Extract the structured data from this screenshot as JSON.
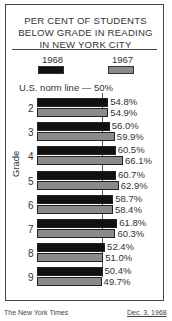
{
  "chart_data": {
    "type": "bar",
    "orientation": "horizontal",
    "title": "PER CENT OF STUDENTS BELOW GRADE IN READING IN NEW YORK CITY",
    "title_lines": [
      "PER CENT OF STUDENTS",
      "BELOW GRADE IN READING",
      "IN NEW YORK CITY"
    ],
    "xlabel": "",
    "ylabel": "Grade",
    "categories": [
      "2",
      "3",
      "4",
      "5",
      "6",
      "7",
      "8",
      "9"
    ],
    "series": [
      {
        "name": "1968",
        "color": "#111111",
        "values": [
          54.8,
          56.0,
          60.5,
          60.7,
          58.7,
          61.8,
          52.4,
          50.4
        ],
        "labels": [
          "54.8%",
          "56.0%",
          "60.5%",
          "60.7%",
          "58.7%",
          "61.8%",
          "52.4%",
          "50.4%"
        ]
      },
      {
        "name": "1967",
        "color": "#8a8a8a",
        "values": [
          54.9,
          59.9,
          66.1,
          62.9,
          58.4,
          60.3,
          51.0,
          49.7
        ],
        "labels": [
          "54.9%",
          "59.9%",
          "66.1%",
          "62.9%",
          "58.4%",
          "60.3%",
          "51.0%",
          "49.7%"
        ]
      }
    ],
    "reference_line": {
      "label": "U.S. norm line — 50%",
      "value": 50
    },
    "legend_position": "top",
    "grid": false
  },
  "legend": {
    "items": [
      {
        "label": "1968",
        "color": "#111111"
      },
      {
        "label": "1967",
        "color": "#8a8a8a"
      }
    ]
  },
  "footer": {
    "source": "The New York Times",
    "date": "Dec. 3, 1968"
  }
}
